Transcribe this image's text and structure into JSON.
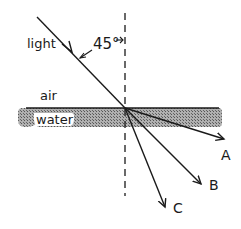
{
  "diagram": {
    "labels": {
      "light": "light",
      "angle": "45°",
      "air": "air",
      "water": "water",
      "ray_a": "A",
      "ray_b": "B",
      "ray_c": "C"
    },
    "colors": {
      "ink": "#1a1a1a",
      "water_fill": "#9a9a9a",
      "background": "#ffffff"
    },
    "incident_angle_deg": 45
  }
}
